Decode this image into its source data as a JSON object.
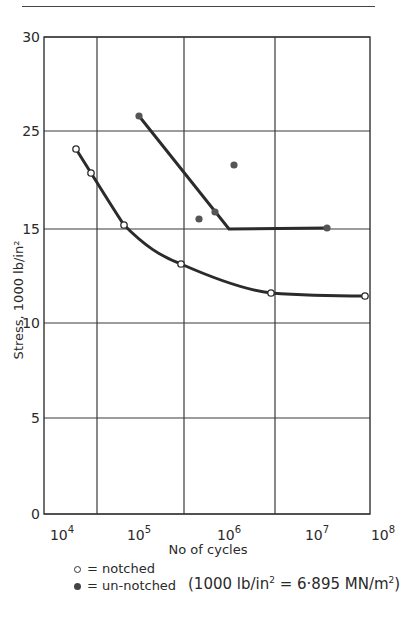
{
  "chart_data": {
    "type": "scatter",
    "title": "",
    "xlabel": "No of cycles",
    "ylabel": "Stress, 1000 lb/in²",
    "x_scale": "log",
    "x_tick_labels": [
      "10^4",
      "10^5",
      "10^6",
      "10^7",
      "10^8"
    ],
    "y_tick_labels": [
      "0",
      "5",
      "10",
      "15",
      "25",
      "30"
    ],
    "y_gridlines_pixel_order_top_to_bottom": [
      "30",
      "25",
      "15",
      "10",
      "5",
      "0"
    ],
    "xlim": [
      10000,
      100000000
    ],
    "ylim": [
      0,
      30
    ],
    "grid": true,
    "legend_position": "below",
    "series": [
      {
        "name": "notched",
        "marker": "open-circle",
        "line": "smooth curve",
        "points": [
          {
            "x": 12000,
            "y": 23.2
          },
          {
            "x": 19000,
            "y": 20.7
          },
          {
            "x": 46000,
            "y": 15.4
          },
          {
            "x": 210000,
            "y": 13.1
          },
          {
            "x": 2500000,
            "y": 11.6
          },
          {
            "x": 31000000,
            "y": 11.4
          }
        ]
      },
      {
        "name": "un-notched",
        "marker": "filled-circle",
        "line": "straight sloped segment then horizontal at 15",
        "points": [
          {
            "x": 69000,
            "y": 25.8
          },
          {
            "x": 350000,
            "y": 16.0
          },
          {
            "x": 540000,
            "y": 16.7
          },
          {
            "x": 890000,
            "y": 21.6
          },
          {
            "x": 11000000,
            "y": 15.0
          }
        ],
        "fit_line": [
          {
            "x": 69000,
            "y": 25.8
          },
          {
            "x": 780000,
            "y": 15.0
          },
          {
            "x": 11000000,
            "y": 15.0
          }
        ]
      }
    ],
    "annotations": [
      "(1000 lb/in² = 6·895 MN/m²)"
    ]
  },
  "legend": {
    "notched_symbol": "○",
    "notched_label": "= notched",
    "unnotched_symbol": "●",
    "unnotched_label": "= un-notched"
  },
  "note": {
    "text_before": "(1000 lb/in",
    "sup1": "2",
    "text_mid": " = 6·895 MN/m",
    "sup2": "2",
    "text_after": ")"
  },
  "axes": {
    "ylabel": "Stress, 1000 lb/in²",
    "xlabel": "No of cycles",
    "y_ticks": [
      {
        "label": "30",
        "py": 37
      },
      {
        "label": "25",
        "py": 131
      },
      {
        "label": "15",
        "py": 229
      },
      {
        "label": "10",
        "py": 323
      },
      {
        "label": "5",
        "py": 418
      },
      {
        "label": "0",
        "py": 514
      }
    ],
    "x_ticks": [
      {
        "base": "10",
        "exp": "4",
        "px": 68
      },
      {
        "base": "10",
        "exp": "5",
        "px": 145
      },
      {
        "base": "10",
        "exp": "6",
        "px": 235
      },
      {
        "base": "10",
        "exp": "7",
        "px": 323
      },
      {
        "base": "10",
        "exp": "8",
        "px": 389
      }
    ],
    "v_gridlines_px": [
      97,
      184,
      275
    ],
    "frame": {
      "left": 44,
      "right": 370,
      "top": 37,
      "bottom": 514
    }
  },
  "pixels": {
    "notched": [
      [
        76,
        149
      ],
      [
        91,
        173
      ],
      [
        124,
        225
      ],
      [
        181,
        264
      ],
      [
        271,
        293
      ],
      [
        365,
        296
      ]
    ],
    "unnotched": [
      [
        139,
        116
      ],
      [
        199,
        219
      ],
      [
        215,
        212
      ],
      [
        234,
        165
      ],
      [
        327,
        228
      ]
    ],
    "unnotched_line": [
      [
        139,
        116
      ],
      [
        229,
        229
      ],
      [
        327,
        228
      ]
    ],
    "notched_curve": "M76,149 L91,173 C103,192 114,210 124,225 C145,246 160,256 181,264 C215,279 245,290 271,293 C310,296 340,296 365,296"
  },
  "colors": {
    "ink": "#2a2a2a",
    "grid": "#3a3a3a",
    "marker_fill": "#555555",
    "background": "#ffffff"
  }
}
